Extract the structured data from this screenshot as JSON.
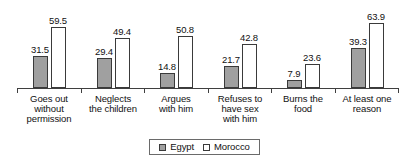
{
  "chart_data": {
    "type": "bar",
    "title": "",
    "subtitle": "",
    "xlabel": "",
    "ylabel": "",
    "ylim": [
      0,
      70
    ],
    "grid": false,
    "legend_position": "bottom-center",
    "value_labels_shown": true,
    "categories": [
      "Goes out without permission",
      "Neglects the children",
      "Argues with him",
      "Refuses to have sex with him",
      "Burns the food",
      "At least one reason"
    ],
    "category_lines": [
      [
        "Goes out",
        "without",
        "permission"
      ],
      [
        "Neglects",
        "the children"
      ],
      [
        "Argues",
        "with him"
      ],
      [
        "Refuses to",
        "have sex",
        "with him"
      ],
      [
        "Burns the",
        "food"
      ],
      [
        "At least one",
        "reason"
      ]
    ],
    "series": [
      {
        "name": "Egypt",
        "color": "#a0a0a0",
        "values": [
          31.5,
          29.4,
          14.8,
          21.7,
          7.9,
          39.3
        ],
        "value_labels": [
          "31.5",
          "29.4",
          "14.8",
          "21.7",
          "7.9",
          "39.3"
        ]
      },
      {
        "name": "Morocco",
        "color": "#ffffff",
        "values": [
          59.5,
          49.4,
          50.8,
          42.8,
          23.6,
          63.9
        ],
        "value_labels": [
          "59.5",
          "49.4",
          "50.8",
          "42.8",
          "23.6",
          "63.9"
        ]
      }
    ]
  },
  "legend": {
    "items": [
      {
        "label": "Egypt",
        "swatch": "egypt-swatch"
      },
      {
        "label": "Morocco",
        "swatch": "morocco-swatch"
      }
    ]
  },
  "colors": {
    "egypt_fill": "#a0a0a0",
    "morocco_fill": "#ffffff",
    "bar_border": "#3a3a3a",
    "axis": "#3f3f3f",
    "text": "#111111",
    "background": "#ffffff"
  }
}
